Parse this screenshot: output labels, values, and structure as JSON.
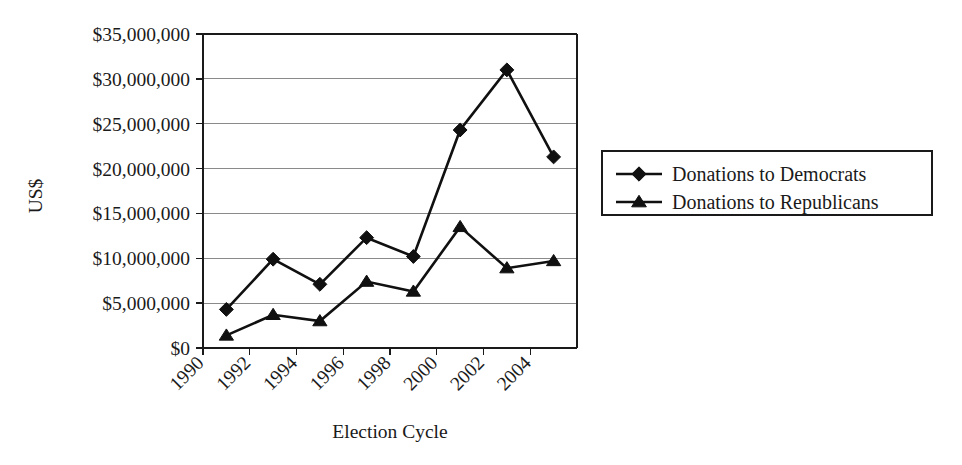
{
  "chart_data": {
    "type": "line",
    "title": "",
    "xlabel": "Election Cycle",
    "ylabel": "US$",
    "x": [
      1991,
      1993,
      1995,
      1997,
      1999,
      2001,
      2003,
      2005
    ],
    "xlim": [
      1990,
      2006
    ],
    "ylim": [
      0,
      35000000
    ],
    "ytick_values": [
      0,
      5000000,
      10000000,
      15000000,
      20000000,
      25000000,
      30000000,
      35000000
    ],
    "ytick_labels": [
      "$0",
      "$5,000,000",
      "$10,000,000",
      "$15,000,000",
      "$20,000,000",
      "$25,000,000",
      "$30,000,000",
      "$35,000,000"
    ],
    "xtick_values": [
      1990,
      1992,
      1994,
      1996,
      1998,
      2000,
      2002,
      2004
    ],
    "xtick_labels": [
      "1990",
      "1992",
      "1994",
      "1996",
      "1998",
      "2000",
      "2002",
      "2004"
    ],
    "xtick_rotation": 45,
    "grid": "horizontal",
    "legend_position": "right",
    "series": [
      {
        "name": "Donations to Democrats",
        "marker": "diamond",
        "color": "#101010",
        "values": [
          4300000,
          9900000,
          7100000,
          12300000,
          10200000,
          24300000,
          31000000,
          21300000
        ]
      },
      {
        "name": "Donations to Republicans",
        "marker": "triangle",
        "color": "#101010",
        "values": [
          1400000,
          3700000,
          3000000,
          7400000,
          6300000,
          13500000,
          8900000,
          9700000
        ]
      }
    ]
  },
  "legend": {
    "items": [
      {
        "label": "Donations to Democrats",
        "marker": "diamond"
      },
      {
        "label": "Donations to Republicans",
        "marker": "triangle"
      }
    ]
  }
}
